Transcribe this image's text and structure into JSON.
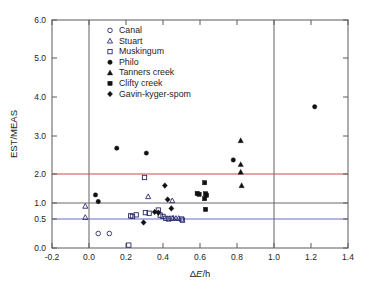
{
  "chart_data": {
    "type": "scatter",
    "title": "",
    "xlabel": "ΔE/h",
    "ylabel": "EST/MEAS",
    "xlim": [
      -0.2,
      1.4
    ],
    "ylim": [
      0.0,
      6.0
    ],
    "xticks": [
      "-0.2",
      "0.0",
      "0.2",
      "0.4",
      "0.6",
      "0.8",
      "1.0",
      "1.2",
      "1.4"
    ],
    "xtick_values": [
      -0.2,
      0.0,
      0.2,
      0.4,
      0.6,
      0.8,
      1.0,
      1.2,
      1.4
    ],
    "yticks": [
      "0.0",
      "0.5",
      "1.0",
      "2.0",
      "3.0",
      "4.0",
      "5.0",
      "6.0"
    ],
    "ytick_values": [
      0.0,
      0.5,
      1.0,
      2.0,
      3.0,
      4.0,
      5.0,
      6.0
    ],
    "y_axis_note": "non-uniform (broken) y scale: 0.0-2.0 compressed, 2.0-6.0 linear",
    "grid": false,
    "reference_lines": {
      "horizontal": [
        {
          "value": 2.0,
          "color": "#c94b4b"
        },
        {
          "value": 1.0,
          "color": "#6a6a6a"
        },
        {
          "value": 0.5,
          "color": "#6b6bc9"
        }
      ],
      "vertical": [
        {
          "value": 0.0,
          "color": "#6e6e6e"
        },
        {
          "value": 1.0,
          "color": "#6e6e6e"
        }
      ]
    },
    "legend_position": "upper-left-inside",
    "series": [
      {
        "name": "Canal",
        "marker": "open-circle",
        "color": "#2b2b6e",
        "points": [
          [
            0.05,
            0.25
          ],
          [
            0.11,
            0.25
          ]
        ]
      },
      {
        "name": "Stuart",
        "marker": "open-triangle",
        "color": "#2b2b6e",
        "points": [
          [
            -0.02,
            0.9
          ],
          [
            -0.02,
            0.55
          ],
          [
            0.32,
            1.22
          ],
          [
            0.45,
            1.08
          ],
          [
            0.455,
            0.53
          ],
          [
            0.47,
            0.52
          ],
          [
            0.485,
            0.52
          ]
        ]
      },
      {
        "name": "Muskingum",
        "marker": "open-square",
        "color": "#2b2b6e",
        "points": [
          [
            0.215,
            0.05
          ],
          [
            0.225,
            0.6
          ],
          [
            0.235,
            0.58
          ],
          [
            0.255,
            0.63
          ],
          [
            0.3,
            1.88
          ],
          [
            0.305,
            0.7
          ],
          [
            0.325,
            0.68
          ],
          [
            0.375,
            0.78
          ],
          [
            0.385,
            0.62
          ],
          [
            0.4,
            0.58
          ],
          [
            0.415,
            0.52
          ],
          [
            0.43,
            0.5
          ],
          [
            0.445,
            0.52
          ],
          [
            0.5,
            0.5
          ],
          [
            0.505,
            0.48
          ]
        ]
      },
      {
        "name": "Philo",
        "marker": "filled-circle",
        "color": "#111111",
        "points": [
          [
            0.035,
            1.28
          ],
          [
            0.05,
            1.05
          ],
          [
            0.15,
            2.68
          ],
          [
            0.31,
            2.55
          ],
          [
            0.78,
            2.37
          ],
          [
            1.22,
            3.75
          ]
        ]
      },
      {
        "name": "Tanners creek",
        "marker": "filled-triangle",
        "color": "#111111",
        "points": [
          [
            0.82,
            2.88
          ],
          [
            0.82,
            2.25
          ],
          [
            0.82,
            2.05
          ],
          [
            0.825,
            1.6
          ]
        ]
      },
      {
        "name": "Clifty creek",
        "marker": "filled-square",
        "color": "#111111",
        "points": [
          [
            0.585,
            1.33
          ],
          [
            0.595,
            1.3
          ],
          [
            0.625,
            1.7
          ],
          [
            0.63,
            1.32
          ],
          [
            0.635,
            1.27
          ],
          [
            0.625,
            1.15
          ],
          [
            0.63,
            0.8
          ]
        ]
      },
      {
        "name": "Gavin-kyger-spom",
        "marker": "filled-diamond",
        "color": "#111111",
        "points": [
          [
            0.295,
            0.44
          ],
          [
            0.355,
            0.72
          ],
          [
            0.375,
            0.7
          ],
          [
            0.41,
            1.6
          ],
          [
            0.425,
            1.12
          ],
          [
            0.445,
            0.83
          ]
        ]
      }
    ]
  },
  "legend": {
    "items": [
      {
        "label": "Canal",
        "marker": "open-circle"
      },
      {
        "label": "Stuart",
        "marker": "open-triangle"
      },
      {
        "label": "Muskingum",
        "marker": "open-square"
      },
      {
        "label": "Philo",
        "marker": "filled-circle"
      },
      {
        "label": "Tanners creek",
        "marker": "filled-triangle"
      },
      {
        "label": "Clifty creek",
        "marker": "filled-square"
      },
      {
        "label": "Gavin-kyger-spom",
        "marker": "filled-diamond"
      }
    ]
  },
  "axes": {
    "y_title": "EST/MEAS",
    "x_title_delta": "Δ",
    "x_title_e": "E",
    "x_title_slash_h": "/h"
  }
}
